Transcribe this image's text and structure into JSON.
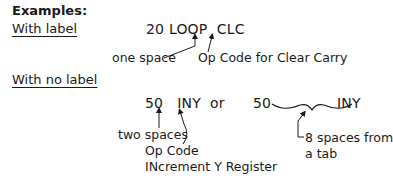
{
  "heading": "Examples:",
  "with_label": {
    "title": "With label",
    "code_line": {
      "line_number": "20",
      "label": "LOOP",
      "opcode": "CLC"
    },
    "annotations": {
      "space_note": "one space",
      "opcode_note": "Op Code for Clear Carry"
    }
  },
  "with_no_label": {
    "title": "With no label",
    "code_line_a": {
      "line_number": "50",
      "opcode": "INY"
    },
    "separator": "or",
    "code_line_b": {
      "line_number": "50",
      "opcode": "INY"
    },
    "annotations": {
      "space_note": "two spaces",
      "opcode_note_1": "Op Code",
      "opcode_note_2": "INcrement Y Register",
      "tab_note_1": "8 spaces from",
      "tab_note_2": "a tab"
    }
  }
}
